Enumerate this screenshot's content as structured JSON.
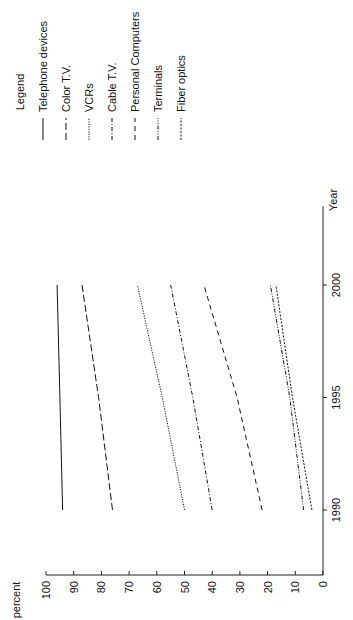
{
  "chart_data": {
    "type": "line",
    "title": "",
    "orientation": "rotated 90° counter-clockwise",
    "xlabel": "Year",
    "ylabel": "percent",
    "x_ticks": [
      "1990",
      "1995",
      "2000"
    ],
    "y_ticks": [
      "0",
      "10",
      "20",
      "30",
      "40",
      "50",
      "60",
      "70",
      "80",
      "90",
      "100"
    ],
    "xlim": [
      1990,
      2000
    ],
    "ylim": [
      0,
      100
    ],
    "grid": false,
    "legend_title": "Legend",
    "legend_position": "top (right side when rotated upright)",
    "x": [
      1990,
      1995,
      2000
    ],
    "series": [
      {
        "name": "Telephone devices",
        "style": "solid",
        "values": [
          94,
          95,
          96
        ]
      },
      {
        "name": "Color T.V.",
        "style": "long-dash",
        "values": [
          76,
          81,
          87
        ]
      },
      {
        "name": "VCRs",
        "style": "dotted",
        "values": [
          50,
          58,
          67
        ]
      },
      {
        "name": "Cable T.V.",
        "style": "dash-dot",
        "values": [
          40,
          47,
          55
        ]
      },
      {
        "name": "Personal Computers",
        "style": "dashed",
        "values": [
          22,
          31,
          43
        ]
      },
      {
        "name": "Terminals",
        "style": "dash-dot-dot",
        "values": [
          7,
          12,
          19
        ]
      },
      {
        "name": "Fiber optics",
        "style": "short-dash",
        "values": [
          4,
          11,
          17
        ]
      }
    ]
  },
  "legend": {
    "title": "Legend",
    "items": [
      "Telephone devices",
      "Color T.V.",
      "VCRs",
      "Cable T.V.",
      "Personal Computers",
      "Terminals",
      "Fiber optics"
    ]
  },
  "axes": {
    "xlabel": "Year",
    "ylabel": "percent"
  }
}
